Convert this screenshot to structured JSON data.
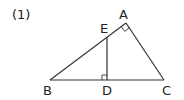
{
  "problem_label": "(1)",
  "points": {
    "A": {
      "label": "A",
      "x": 126,
      "y": 23
    },
    "B": {
      "label": "B",
      "x": 50,
      "y": 80
    },
    "C": {
      "label": "C",
      "x": 164,
      "y": 80
    },
    "D": {
      "label": "D",
      "x": 107,
      "y": 80
    },
    "E": {
      "label": "E",
      "x": 107,
      "y": 36
    }
  },
  "segments": [
    "AB",
    "AC",
    "BC",
    "ED"
  ],
  "right_angles": [
    "BAC",
    "EDB"
  ],
  "colors": {
    "stroke": "#333333",
    "text": "#222222",
    "background": "#ffffff"
  }
}
